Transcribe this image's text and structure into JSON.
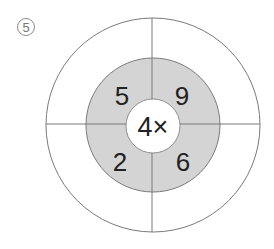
{
  "problem": {
    "number": "5",
    "number_glyph": "⑤"
  },
  "wheel": {
    "center_operation": "4×",
    "multiplier": "4",
    "operator": "×",
    "inner_numbers": {
      "top_left": "5",
      "top_right": "9",
      "bottom_left": "2",
      "bottom_right": "6"
    },
    "outer_answers": {
      "top_left": "",
      "top_right": "",
      "bottom_left": "",
      "bottom_right": ""
    },
    "colors": {
      "ring_fill": "#d4d4d4",
      "line": "#7a7a7a",
      "text": "#222222",
      "background": "#ffffff"
    }
  }
}
